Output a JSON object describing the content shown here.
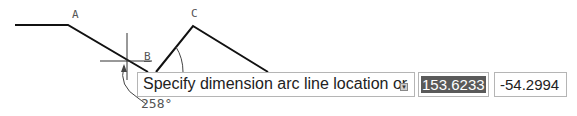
{
  "drawing": {
    "point_labels": [
      "A",
      "B",
      "C"
    ],
    "angle_label": "258°"
  },
  "dynamic_input": {
    "prompt": "Specify dimension arc line location or",
    "options_icon": "down-arrow-options-icon",
    "value_1": "153.6233",
    "value_2": "-54.2994"
  },
  "colors": {
    "geometry": "#111111",
    "annotation": "#555555",
    "selection_bg": "#5a5a5a"
  }
}
